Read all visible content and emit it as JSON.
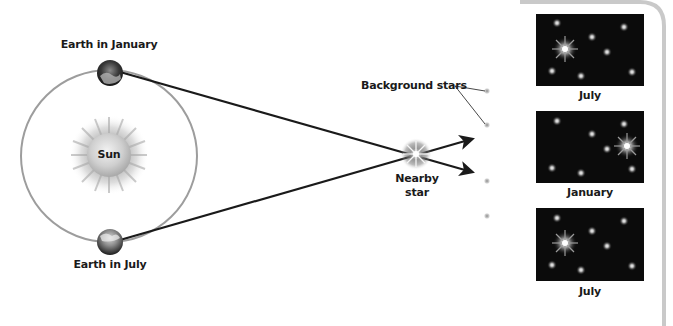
{
  "diagram": {
    "labels": {
      "earth_january": "Earth in January",
      "earth_july": "Earth in July",
      "sun": "Sun",
      "nearby_star_line1": "Nearby",
      "nearby_star_line2": "star",
      "background_stars": "Background stars"
    },
    "panels": [
      {
        "label": "July",
        "bright_star_side": "left"
      },
      {
        "label": "January",
        "bright_star_side": "right"
      },
      {
        "label": "July",
        "bright_star_side": "left"
      }
    ],
    "colors": {
      "line": "#1a1a1a",
      "orbit": "#9a9a9a",
      "sky": "#0b0b0b",
      "panel_border": "#c8c8c8"
    }
  }
}
